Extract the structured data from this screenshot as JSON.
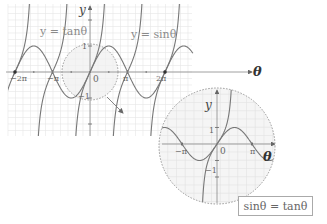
{
  "diagram": {
    "main_graph": {
      "curves": [
        {
          "name": "tan",
          "label": "y = tanθ"
        },
        {
          "name": "sin",
          "label": "y = sinθ"
        }
      ],
      "axes": {
        "x_label": "θ",
        "y_label": "y"
      },
      "x_ticks": [
        "−2π",
        "−π",
        "0",
        "π",
        "2π"
      ],
      "y_ticks": [
        "1",
        "−1"
      ],
      "origin_label": "0",
      "highlight": "dashed circle around origin with arrow to zoomed view"
    },
    "zoom_view": {
      "axes": {
        "x_label": "θ",
        "y_label": "y"
      },
      "x_ticks": [
        "−π",
        "0",
        "π"
      ],
      "y_ticks": [
        "1",
        "−1"
      ]
    },
    "equation_box": {
      "text": "sinθ = tanθ"
    }
  },
  "labels": {
    "tan_label": "y = tanθ",
    "sin_label": "y = sinθ",
    "main_y": "y",
    "main_theta": "θ",
    "main_one": "1",
    "main_neg_one": "−1",
    "main_zero": "0",
    "main_neg_2pi": "−2π",
    "main_neg_pi": "−π",
    "main_pi": "π",
    "main_2pi": "2π",
    "zoom_y": "y",
    "zoom_theta": "θ",
    "zoom_one": "1",
    "zoom_neg_one": "−1",
    "zoom_zero": "0",
    "zoom_neg_pi": "−π",
    "zoom_pi": "π",
    "equation": "sinθ = tanθ"
  },
  "colors": {
    "curve": "#777777",
    "grid": "#e6e6e6",
    "axis": "#888888",
    "circle_fill": "#f2f2f2",
    "circle_stroke": "#999999"
  }
}
